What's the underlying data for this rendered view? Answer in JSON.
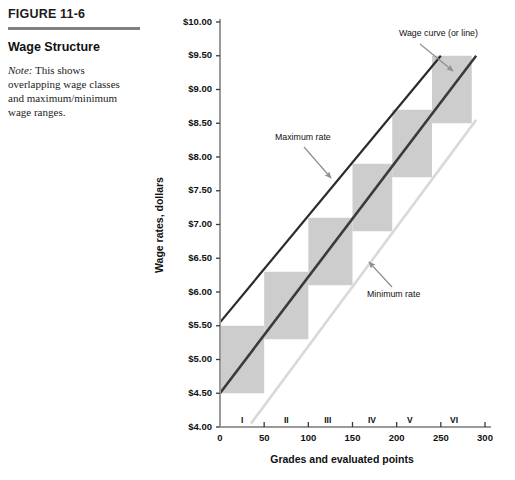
{
  "figure": {
    "number": "FIGURE 11-6",
    "title": "Wage Structure",
    "note_lead": "Note:",
    "note_text": " This shows overlapping wage classes and maximum/minimum wage ranges."
  },
  "chart_data": {
    "type": "area",
    "title": "Wage Structure",
    "xlabel": "Grades and evaluated points",
    "ylabel": "Wage rates, dollars",
    "xlim": [
      0,
      300
    ],
    "ylim": [
      4.0,
      10.0
    ],
    "grid": false,
    "legend": "none",
    "x_ticks": [
      "0",
      "50",
      "100",
      "150",
      "200",
      "250",
      "300"
    ],
    "x_tick_values": [
      0,
      50,
      100,
      150,
      200,
      250,
      300
    ],
    "y_ticks": [
      "$4.00",
      "$4.50",
      "$5.00",
      "$5.50",
      "$6.00",
      "$6.50",
      "$7.00",
      "$7.50",
      "$8.00",
      "$8.50",
      "$9.00",
      "$9.50",
      "$10.00"
    ],
    "y_tick_values": [
      4.0,
      4.5,
      5.0,
      5.5,
      6.0,
      6.5,
      7.0,
      7.5,
      8.0,
      8.5,
      9.0,
      9.5,
      10.0
    ],
    "grade_labels": [
      "I",
      "II",
      "III",
      "IV",
      "V",
      "VI"
    ],
    "grade_label_x": [
      25,
      75,
      122,
      172,
      215,
      265
    ],
    "wage_classes": [
      {
        "grade": "I",
        "x_start": 0,
        "x_end": 50,
        "wage_min": 4.5,
        "wage_max": 5.5
      },
      {
        "grade": "II",
        "x_start": 50,
        "x_end": 100,
        "wage_min": 5.3,
        "wage_max": 6.3
      },
      {
        "grade": "III",
        "x_start": 100,
        "x_end": 150,
        "wage_min": 6.1,
        "wage_max": 7.1
      },
      {
        "grade": "IV",
        "x_start": 150,
        "x_end": 195,
        "wage_min": 6.9,
        "wage_max": 7.9
      },
      {
        "grade": "V",
        "x_start": 195,
        "x_end": 240,
        "wage_min": 7.7,
        "wage_max": 8.7
      },
      {
        "grade": "VI",
        "x_start": 240,
        "x_end": 285,
        "wage_min": 8.5,
        "wage_max": 9.5
      }
    ],
    "series": [
      {
        "name": "Maximum rate",
        "style": "solid-dark",
        "color": "#2b2b2b",
        "x": [
          0,
          250
        ],
        "values": [
          5.55,
          9.5
        ]
      },
      {
        "name": "Wage curve (or line)",
        "style": "solid-dark",
        "color": "#3a3a3a",
        "x": [
          0,
          290
        ],
        "values": [
          4.5,
          9.5
        ]
      },
      {
        "name": "Minimum rate",
        "style": "solid-light",
        "color": "#d9d9d9",
        "x": [
          35,
          290
        ],
        "values": [
          4.05,
          8.55
        ]
      }
    ],
    "annotations": [
      {
        "text": "Wage curve (or line)",
        "label_x": 399,
        "label_y": 36,
        "arrow_from_x": 420,
        "arrow_from_y": 44,
        "arrow_to_x": 453,
        "arrow_to_y": 71
      },
      {
        "text": "Maximum rate",
        "label_x": 275,
        "label_y": 140,
        "arrow_from_x": 304,
        "arrow_from_y": 147,
        "arrow_to_x": 331,
        "arrow_to_y": 178
      },
      {
        "text": "Minimum rate",
        "label_x": 367,
        "label_y": 297,
        "arrow_from_x": 392,
        "arrow_from_y": 287,
        "arrow_to_x": 369,
        "arrow_to_y": 262
      }
    ],
    "colors": {
      "box_fill": "#cdcdcd",
      "axis": "#9a9a9a",
      "max_line": "#2b2b2b",
      "wage_line": "#3a3a3a",
      "min_line": "#dcdcdc",
      "annotation_arrow": "#8f8f8f"
    }
  }
}
